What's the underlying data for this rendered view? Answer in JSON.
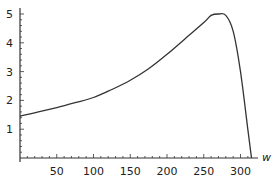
{
  "chart_data": {
    "type": "line",
    "title": "",
    "xlabel": "w",
    "ylabel": "",
    "xlim": [
      0,
      320
    ],
    "ylim": [
      0,
      5
    ],
    "grid": false,
    "legend": null,
    "x_ticks": [
      50,
      100,
      150,
      200,
      250,
      300
    ],
    "y_ticks": [
      1,
      2,
      3,
      4,
      5
    ],
    "series": [
      {
        "name": "curve",
        "x": [
          0,
          25,
          50,
          75,
          100,
          125,
          150,
          175,
          200,
          225,
          250,
          260,
          270,
          280,
          290,
          300,
          310,
          315
        ],
        "y": [
          1.45,
          1.6,
          1.75,
          1.92,
          2.1,
          2.38,
          2.7,
          3.1,
          3.6,
          4.15,
          4.7,
          4.95,
          5.0,
          4.95,
          4.4,
          3.0,
          1.0,
          0
        ]
      }
    ]
  },
  "axis": {
    "x_label": "w",
    "x_tick_labels": [
      "50",
      "100",
      "150",
      "200",
      "250",
      "300"
    ],
    "y_tick_labels": [
      "1",
      "2",
      "3",
      "4",
      "5"
    ]
  }
}
